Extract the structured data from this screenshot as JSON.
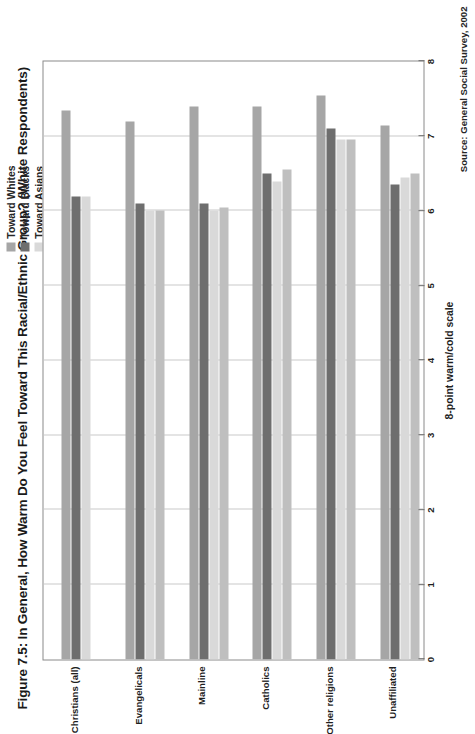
{
  "figure": {
    "title": "Figure 7.5: In General, How Warm Do You Feel Toward This Racial/Ethnic Group?  (White Respondents)",
    "source": "Source: General Social Survey, 2002",
    "axis_title": "8-point warm/cold scale"
  },
  "legend": {
    "items": [
      {
        "label": "Toward Whites",
        "color": "#a6a6a6"
      },
      {
        "label": "Toward Blacks",
        "color": "#6e6e6e"
      },
      {
        "label": "Toward Asians",
        "color": "#d9d9d9"
      },
      {
        "label": "Toward Hispanics",
        "color": "#bfbfbf"
      }
    ]
  },
  "chart_data": {
    "type": "bar",
    "orientation": "vertical",
    "title": "Figure 7.5: In General, How Warm Do You Feel Toward This Racial/Ethnic Group?  (White Respondents)",
    "xlabel": "",
    "ylabel": "8-point warm/cold scale",
    "ylim": [
      0,
      8
    ],
    "yticks": [
      0,
      1,
      2,
      3,
      4,
      5,
      6,
      7,
      8
    ],
    "ytick_labels": [
      "0",
      "1",
      "2",
      "3",
      "4",
      "5",
      "6",
      "7",
      "8"
    ],
    "grid": true,
    "legend_position": "top-right",
    "categories": [
      "Christians (all)",
      "Evangelicals",
      "Mainline",
      "Catholics",
      "Other religions",
      "Unaffiliated"
    ],
    "series": [
      {
        "name": "Toward Whites",
        "color": "#a6a6a6",
        "values": [
          7.35,
          7.2,
          7.4,
          7.4,
          7.55,
          7.15
        ]
      },
      {
        "name": "Toward Blacks",
        "color": "#6e6e6e",
        "values": [
          6.2,
          6.1,
          6.1,
          6.5,
          7.1,
          6.35
        ]
      },
      {
        "name": "Toward Asians",
        "color": "#d9d9d9",
        "values": [
          6.2,
          6.0,
          6.0,
          6.4,
          6.95,
          6.45
        ]
      },
      {
        "name": "Toward Hispanics",
        "color": "#bfbfbf",
        "values": [
          null,
          6.0,
          6.05,
          6.55,
          6.95,
          6.5
        ]
      }
    ],
    "source": "Source: General Social Survey, 2002"
  },
  "colors": {
    "plot_border": "#8a8a8a",
    "gridline": "#c9c9c9",
    "background": "#ffffff",
    "text": "#1f1f1f"
  }
}
